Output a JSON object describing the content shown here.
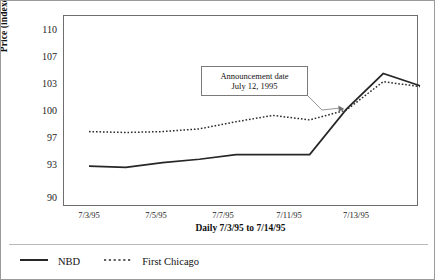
{
  "chart_data": {
    "type": "line",
    "title": "",
    "xlabel": "Daily 7/3/95 to 7/14/95",
    "ylabel": "Price (indexed on July 12, 1995)",
    "ylim": [
      90,
      110
    ],
    "yticks": [
      110,
      107,
      103,
      100,
      97,
      93,
      90
    ],
    "grid": false,
    "legend_position": "below-plot-left",
    "x_tick_labels": [
      "7/3/95",
      "7/5/95",
      "7/7/95",
      "7/11/95",
      "7/13/95"
    ],
    "x_tick_positions": [
      0,
      2,
      4,
      6,
      8
    ],
    "x": [
      0,
      1,
      2,
      3,
      4,
      5,
      6,
      7,
      8,
      9
    ],
    "series": [
      {
        "name": "NBD",
        "style": "solid",
        "color": "#262626",
        "values": [
          92.8,
          92.7,
          93.2,
          93.7,
          94.4,
          94.4,
          94.4,
          100.1,
          104.4,
          102.7
        ]
      },
      {
        "name": "First Chicago",
        "style": "dotted",
        "color": "#2b2b2b",
        "values": [
          97.6,
          97.5,
          97.6,
          97.9,
          98.7,
          99.4,
          98.9,
          100.0,
          103.2,
          102.6
        ]
      }
    ],
    "annotations": [
      {
        "name": "announcement-date",
        "line1": "Announcement date",
        "line2": "July 12, 1995",
        "points_to_x": 7,
        "points_to_y": 100.0
      }
    ]
  },
  "legend": {
    "items": [
      {
        "label": "NBD",
        "style": "solid"
      },
      {
        "label": "First Chicago",
        "style": "dotted"
      }
    ]
  },
  "axis": {
    "y_label": "Price (indexed on July 12, 1995)",
    "x_label": "Daily 7/3/95 to 7/14/95",
    "y_ticks": [
      "110",
      "107",
      "103",
      "100",
      "97",
      "93",
      "90"
    ],
    "x_ticks": [
      "7/3/95",
      "7/5/95",
      "7/7/95",
      "7/11/95",
      "7/13/95"
    ]
  },
  "annotation": {
    "line1": "Announcement date",
    "line2": "July 12, 1995"
  }
}
